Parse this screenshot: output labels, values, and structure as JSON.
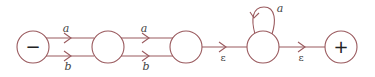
{
  "diagram": {
    "type": "finite-automaton",
    "colors": {
      "stroke": "#9a5a5e",
      "text": "#444444"
    },
    "states": [
      {
        "id": "s1",
        "label": "−",
        "role": "start"
      },
      {
        "id": "s2",
        "label": ""
      },
      {
        "id": "s3",
        "label": ""
      },
      {
        "id": "s4",
        "label": ""
      },
      {
        "id": "s5",
        "label": "+",
        "role": "final"
      }
    ],
    "edges": [
      {
        "from": "s1",
        "to": "s2",
        "label": "a"
      },
      {
        "from": "s1",
        "to": "s2",
        "label": "b"
      },
      {
        "from": "s2",
        "to": "s3",
        "label": "a"
      },
      {
        "from": "s2",
        "to": "s3",
        "label": "b"
      },
      {
        "from": "s3",
        "to": "s4",
        "label": "ε"
      },
      {
        "from": "s4",
        "to": "s4",
        "label": "a"
      },
      {
        "from": "s4",
        "to": "s5",
        "label": "ε"
      }
    ]
  }
}
